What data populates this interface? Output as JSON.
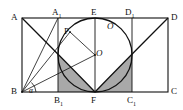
{
  "figure": {
    "background_color": "#ffffff",
    "stroke_color": "#111111",
    "shade_color": "#a9a9a9",
    "width": 183,
    "height": 110
  },
  "labels": {
    "A": "A",
    "A1_letter": "A",
    "A1_sub": "1",
    "E": "E",
    "D1_letter": "D",
    "D1_sub": "1",
    "D": "D",
    "P": "P",
    "O_upper": "O",
    "O_center": "O",
    "B": "B",
    "B1_letter": "B",
    "B1_sub": "1",
    "F": "F",
    "C1_letter": "C",
    "C1_sub": "1",
    "C": "C",
    "alpha": "α"
  },
  "geometry": {
    "outer_rect": {
      "A": [
        22,
        18
      ],
      "D": [
        168,
        18
      ],
      "C": [
        168,
        92
      ],
      "B": [
        22,
        92
      ]
    },
    "inner_rect": {
      "A1": [
        58,
        18
      ],
      "D1": [
        132,
        18
      ],
      "C1": [
        132,
        92
      ],
      "B1": [
        58,
        92
      ]
    },
    "circle": {
      "center": [
        95,
        55
      ],
      "radius": 37,
      "center_label_point": [
        95,
        55
      ]
    },
    "points": {
      "E": [
        95,
        18
      ],
      "F": [
        95,
        92
      ],
      "P": [
        70,
        32
      ],
      "O": [
        95,
        55
      ]
    },
    "vertical_axis": {
      "from": [
        95,
        18
      ],
      "to": [
        95,
        92
      ]
    },
    "segments": [
      {
        "name": "B-to-P",
        "from": [
          22,
          92
        ],
        "to": [
          70,
          32
        ]
      },
      {
        "name": "B-to-A1-top",
        "from": [
          22,
          92
        ],
        "to": [
          58,
          18
        ]
      },
      {
        "name": "B-to-O",
        "from": [
          22,
          92
        ],
        "to": [
          95,
          55
        ]
      },
      {
        "name": "P-to-O",
        "from": [
          70,
          32
        ],
        "to": [
          95,
          55
        ]
      }
    ],
    "arcs": [
      {
        "name": "left-parabola-A-to-F",
        "start": [
          22,
          18
        ],
        "end": [
          95,
          92
        ],
        "type": "parabolic"
      },
      {
        "name": "right-parabola-D-to-F",
        "start": [
          168,
          18
        ],
        "end": [
          95,
          92
        ],
        "type": "parabolic"
      }
    ],
    "angle": {
      "vertex": "B",
      "label": "α",
      "at": [
        33,
        88
      ]
    }
  }
}
